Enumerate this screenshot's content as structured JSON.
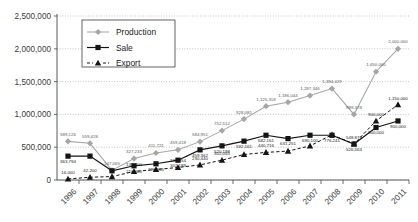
{
  "chart_data": {
    "type": "line",
    "title": "",
    "xlabel": "",
    "ylabel": "",
    "ylim": [
      0,
      2500000
    ],
    "yticks": [
      "0",
      "500,000",
      "1,000,000",
      "1,500,000",
      "2,000,000",
      "2,500,000"
    ],
    "ytick_values": [
      0,
      500000,
      1000000,
      1500000,
      2000000,
      2500000
    ],
    "grid": true,
    "legend_position": "top-left",
    "categories": [
      "1996",
      "1997",
      "1998",
      "1999",
      "2000",
      "2001",
      "2002",
      "2003",
      "2004",
      "2005",
      "2006",
      "2007",
      "2008",
      "2009",
      "2010",
      "2011"
    ],
    "series": [
      {
        "name": "Production",
        "marker": "diamond",
        "color": "#a6a6a6",
        "linestyle": "solid",
        "values": [
          589126,
          559428,
          147065,
          327233,
          411721,
          459418,
          584951,
          752512,
          928081,
          1125318,
          1186044,
          1287346,
          1394029,
          999378,
          1650000,
          2000000
        ],
        "labels": [
          "589,126",
          "559,428",
          "147,065",
          "327,233",
          "411,721",
          "459,418",
          "584,951",
          "752,512",
          "928,081",
          "1,125,318",
          "1,186,044",
          "1,287,346",
          "1,394,029",
          "999,378",
          "1,650,000",
          "2,000,000"
        ]
      },
      {
        "name": "Sale",
        "marker": "square",
        "color": "#141414",
        "linestyle": "solid",
        "values": [
          363794,
          363794,
          140000,
          216300,
          246965,
          302189,
          459362,
          520198,
          592161,
          682161,
          631251,
          682161,
          682161,
          548873,
          800000,
          900000
        ],
        "labels": [
          "363,794",
          "",
          "",
          "216,300",
          "296,965",
          "302,189",
          "459,362",
          "520,198",
          "592,161",
          "682,161",
          "631,251",
          "690,100",
          "776,241",
          "526,563",
          "800,000",
          "900,000"
        ]
      },
      {
        "name": "Export",
        "marker": "triangle",
        "color": "#141414",
        "linestyle": "dashed",
        "values": [
          16000,
          42200,
          52000,
          130000,
          160000,
          190554,
          230440,
          302055,
          389440,
          420716,
          440716,
          520198,
          690100,
          548873,
          900000,
          1150000
        ],
        "labels": [
          "16,000",
          "42,200",
          "",
          "130,000",
          "",
          "190,554",
          "230,440",
          "302,055",
          "",
          "440,716",
          "",
          "",
          "",
          "548,873",
          "900,000",
          "1,150,000"
        ]
      }
    ],
    "annotations": {
      "prod_2011": "2,000,000",
      "prod_2010": "1,650,000",
      "exp_2011": "1,150,000",
      "sale_2011": "900,000",
      "exp_2010": "900,000",
      "sale_2010": "800,000"
    }
  },
  "legend": {
    "items": [
      {
        "label": "Production",
        "marker": "diamond-marker",
        "color": "#a6a6a6"
      },
      {
        "label": "Sale",
        "marker": "square-marker",
        "color": "#141414"
      },
      {
        "label": "Export",
        "marker": "triangle-marker",
        "color": "#141414"
      }
    ]
  }
}
